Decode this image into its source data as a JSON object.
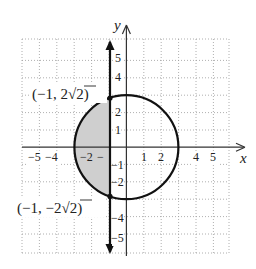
{
  "diagram": {
    "type": "coordinate-plane",
    "x_axis_label": "x",
    "y_axis_label": "y",
    "x_tick_labels": [
      "−5",
      "−4",
      "−2",
      "−",
      "1",
      "2",
      "4",
      "5"
    ],
    "y_tick_labels": [
      "5",
      "4",
      "2",
      "1",
      "−1",
      "−2",
      "−4",
      "−5"
    ],
    "shapes": {
      "circle": {
        "center": [
          0,
          0
        ],
        "radius": 3,
        "equation": "x² + y² = 9"
      },
      "vertical_line": {
        "x": -1,
        "arrows": "both"
      },
      "shaded_region": "interior of circle with x ≤ −1",
      "shade_color": "#c8c8c8"
    },
    "points": [
      {
        "label": "(−1, 2√2)",
        "x": -1,
        "y": 2.828
      },
      {
        "label": "(−1, −2√2)",
        "x": -1,
        "y": -2.828
      }
    ],
    "point_label_parts": {
      "top": {
        "open": "(−1, 2",
        "root": "√",
        "rad": "2",
        "close": ")"
      },
      "bottom": {
        "open": "(−1, −2",
        "root": "√",
        "rad": "2",
        "close": ")"
      }
    }
  }
}
